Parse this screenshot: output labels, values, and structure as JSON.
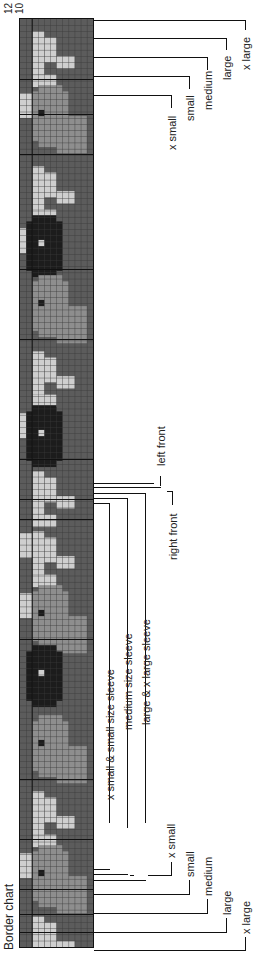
{
  "chart": {
    "title": "Border chart",
    "row_numbers": [
      "12",
      "10"
    ],
    "colors": {
      "background": "#5c5c5c",
      "medium": "#8e8e8e",
      "light": "#cfcfcf",
      "dark": "#1c1c1c",
      "gridline": "#3a3a3a"
    },
    "rows": 12,
    "stitches": 150
  },
  "labels": {
    "top_sizes": [
      "x small",
      "small",
      "medium",
      "large",
      "x large"
    ],
    "bottom_sizes": [
      "x small",
      "small",
      "medium",
      "large",
      "x large"
    ],
    "sleeves": [
      "x small & small size sleeve",
      "medium size sleeve",
      "large & x large sleeve"
    ],
    "fronts": [
      "left front",
      "right front"
    ]
  },
  "chart_data": {
    "type": "table",
    "title": "Border chart",
    "row_labels": [
      "12",
      "10"
    ],
    "size_markers_top": [
      "x small",
      "small",
      "medium",
      "large",
      "x large"
    ],
    "size_markers_bottom": [
      "x small",
      "small",
      "medium",
      "large",
      "x large"
    ],
    "sleeve_markers": [
      "x small & small size sleeve",
      "medium size sleeve",
      "large & x large sleeve"
    ],
    "front_markers": [
      "left front",
      "right front"
    ],
    "palette": [
      "#5c5c5c",
      "#8e8e8e",
      "#cfcfcf",
      "#1c1c1c"
    ]
  }
}
